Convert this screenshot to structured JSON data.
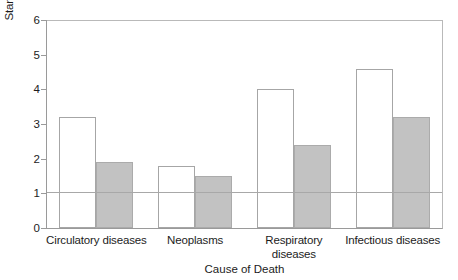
{
  "chart_data": {
    "type": "bar",
    "title": "",
    "subtitle": "",
    "xlabel": "Cause of Death",
    "ylabel": "Standardised mortality ratio",
    "categories": [
      "Circulatory diseases",
      "Neoplasms",
      "Respiratory diseases",
      "Infectious diseases"
    ],
    "series": [
      {
        "name": "series-1",
        "style": "white-outlined",
        "values": [
          3.2,
          1.8,
          4.0,
          4.6
        ]
      },
      {
        "name": "series-2",
        "style": "grey-filled",
        "values": [
          1.9,
          1.5,
          2.4,
          3.2
        ]
      }
    ],
    "ylim": [
      0,
      6
    ],
    "yticks": [
      0,
      1,
      2,
      3,
      4,
      5,
      6
    ],
    "ytick_labels": [
      "0",
      "1",
      "2",
      "3",
      "4",
      "5",
      "6"
    ],
    "grid": false,
    "legend": "none",
    "annotations": [
      {
        "type": "hline",
        "value": 1,
        "label": ""
      }
    ],
    "colors": {
      "series_1_fill": "#ffffff",
      "series_1_stroke": "#a6a6a6",
      "series_2_fill": "#c2c2c2",
      "series_2_stroke": "#ababab",
      "axis": "#9a9a9a",
      "frame": "#b9b9b9",
      "reference_line": "#a8a8a8",
      "text": "#1c1c1c",
      "background": "#ffffff"
    }
  },
  "category_label_lines": [
    [
      "Circulatory diseases"
    ],
    [
      "Neoplasms"
    ],
    [
      "Respiratory",
      "diseases"
    ],
    [
      "Infectious diseases"
    ]
  ]
}
